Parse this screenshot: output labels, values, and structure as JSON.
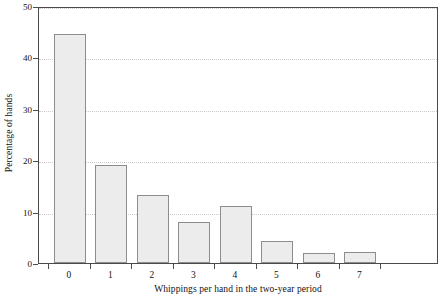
{
  "chart_data": {
    "type": "bar",
    "title": "",
    "subtitle": "",
    "xlabel": "Whippings per hand in the two-year period",
    "ylabel": "Percentage of hands",
    "categories": [
      "0",
      "1",
      "2",
      "3",
      "4",
      "5",
      "6",
      "7"
    ],
    "values": [
      44.5,
      19.0,
      13.2,
      8.0,
      11.0,
      4.3,
      2.0,
      2.2
    ],
    "series": [
      {
        "name": "Percentage of hands",
        "values": [
          44.5,
          19.0,
          13.2,
          8.0,
          11.0,
          4.3,
          2.0,
          2.2
        ]
      }
    ],
    "ylim": [
      0,
      50
    ],
    "yticks": [
      0,
      10,
      20,
      30,
      40,
      50
    ],
    "ytick_labels": [
      "0",
      "10",
      "20",
      "30",
      "40",
      "50"
    ],
    "xtick_labels": [
      "0",
      "1",
      "2",
      "3",
      "4",
      "5",
      "6",
      "7"
    ],
    "grid": "horizontal-dotted",
    "legend": "none",
    "bar_fill_color": "#ececec",
    "bar_border_color": "#8d8d8d",
    "axis_color": "#4a4a4a",
    "grid_color": "#c9c9c9",
    "text_color": "#121212",
    "background_color": "#ffffff"
  }
}
